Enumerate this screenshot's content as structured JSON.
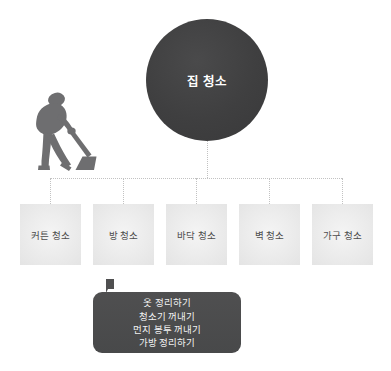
{
  "diagram": {
    "type": "hierarchy-tree",
    "root": {
      "label": "집 청소",
      "shape": "circle",
      "fill_color": "#3f3f40",
      "text_color": "#ffffff"
    },
    "connector": {
      "style": "dotted",
      "color": "#c2c2c2"
    },
    "children": [
      {
        "label": "커튼 청소"
      },
      {
        "label": "방 청소"
      },
      {
        "label": "바닥 청소"
      },
      {
        "label": "벽 청소"
      },
      {
        "label": "가구 청소"
      }
    ],
    "child_box": {
      "fill_color": "#ededed",
      "text_color": "#4c4c4c"
    },
    "callout": {
      "fill_color": "#4a4a4b",
      "text_color": "#f2f2f2",
      "lines": [
        "옷 정리하기",
        "청소기 꺼내기",
        "먼지 봉투 꺼내기",
        "가방 정리하기"
      ]
    },
    "illustration": {
      "name": "person-vacuuming-silhouette",
      "color": "#6e6e70"
    }
  }
}
